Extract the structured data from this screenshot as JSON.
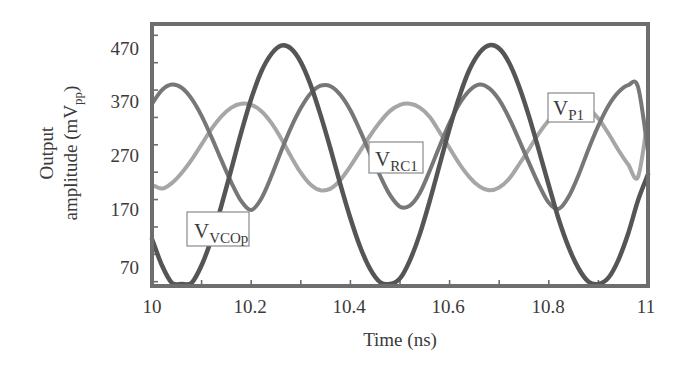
{
  "chart_data": {
    "type": "line",
    "title": "",
    "xlabel": "Time (ns)",
    "ylabel": "Output amplitude (mV_pp)",
    "ylabel_lines": [
      "Output",
      "amplitude (mV",
      "pp",
      ")"
    ],
    "xlim": [
      10,
      11
    ],
    "ylim": [
      30,
      520
    ],
    "x_ticks": [
      10,
      10.2,
      10.4,
      10.6,
      10.8,
      11
    ],
    "x_tick_labels": [
      "10",
      "10.2",
      "10.4",
      "10.6",
      "10.8",
      "11"
    ],
    "x_minor_step": 0.1,
    "y_ticks": [
      70,
      170,
      270,
      370,
      470
    ],
    "y_tick_labels": [
      "70",
      "170",
      "270",
      "370",
      "470"
    ],
    "y_minor_step": 50,
    "grid": false,
    "legend": "inline labels",
    "x": [
      10.0,
      10.02,
      10.04,
      10.06,
      10.08,
      10.1,
      10.12,
      10.14,
      10.16,
      10.18,
      10.2,
      10.22,
      10.24,
      10.26,
      10.28,
      10.3,
      10.32,
      10.34,
      10.36,
      10.38,
      10.4,
      10.42,
      10.44,
      10.46,
      10.48,
      10.5,
      10.52,
      10.54,
      10.56,
      10.58,
      10.6,
      10.62,
      10.64,
      10.66,
      10.68,
      10.7,
      10.72,
      10.74,
      10.76,
      10.78,
      10.8,
      10.82,
      10.84,
      10.86,
      10.88,
      10.9,
      10.92,
      10.94,
      10.96,
      10.98,
      11.0
    ],
    "series": [
      {
        "name": "V_VCOp",
        "label_main": "V",
        "label_sub": "VCOp",
        "color": "#555555",
        "values": [
          123,
          75,
          43,
          32,
          43,
          75,
          123,
          184,
          251,
          318,
          379,
          428,
          460,
          476,
          471,
          446,
          404,
          349,
          287,
          222,
          161,
          108,
          68,
          44,
          38,
          51,
          84,
          132,
          193,
          259,
          325,
          384,
          432,
          463,
          477,
          471,
          445,
          402,
          347,
          285,
          221,
          159,
          108,
          69,
          45,
          39,
          52,
          84,
          133,
          194,
          241
        ]
      },
      {
        "name": "V_RC1",
        "label_main": "V",
        "label_sub": "RC1",
        "color": "#777777",
        "values": [
          370,
          395,
          405,
          399,
          379,
          348,
          309,
          267,
          226,
          192,
          176,
          196,
          236,
          283,
          326,
          362,
          389,
          403,
          402,
          386,
          358,
          320,
          278,
          238,
          203,
          182,
          184,
          207,
          248,
          293,
          335,
          370,
          394,
          405,
          398,
          377,
          344,
          304,
          262,
          222,
          189,
          178,
          200,
          240,
          287,
          330,
          366,
          391,
          404,
          400,
          283
        ]
      },
      {
        "name": "V_P1",
        "label_main": "V",
        "label_sub": "P1",
        "color": "#a6a6a6",
        "values": [
          222,
          215,
          225,
          244,
          268,
          296,
          324,
          347,
          363,
          370,
          368,
          357,
          336,
          307,
          274,
          244,
          222,
          212,
          215,
          231,
          256,
          284,
          312,
          337,
          357,
          368,
          370,
          363,
          346,
          318,
          289,
          260,
          236,
          219,
          212,
          217,
          233,
          259,
          287,
          316,
          340,
          359,
          369,
          369,
          361,
          343,
          316,
          286,
          259,
          237,
          345
        ]
      }
    ],
    "annotations": [
      {
        "series": "V_VCOp",
        "text": "V_VCOp",
        "x": 10.12,
        "y": 115
      },
      {
        "series": "V_RC1",
        "text": "V_RC1",
        "x": 10.44,
        "y": 250
      },
      {
        "series": "V_P1",
        "text": "V_P1",
        "x": 10.82,
        "y": 338
      }
    ]
  },
  "labels": {
    "ylabel_line1": "Output",
    "ylabel_line2_main": "amplitude (mV",
    "ylabel_line2_sub": "pp",
    "ylabel_line2_close": ")",
    "xlabel": "Time (ns)",
    "vco_main": "V",
    "vco_sub": "VCOp",
    "rc_main": "V",
    "rc_sub": "RC1",
    "p1_main": "V",
    "p1_sub": "P1",
    "x_ticks": [
      "10",
      "10.2",
      "10.4",
      "10.6",
      "10.8",
      "11"
    ],
    "y_ticks": [
      "70",
      "170",
      "270",
      "370",
      "470"
    ]
  }
}
